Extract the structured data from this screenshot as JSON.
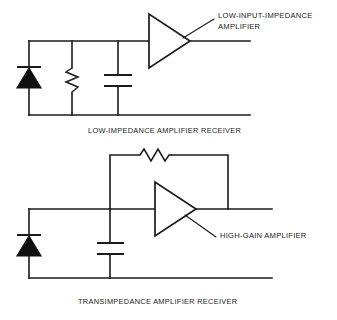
{
  "figure": {
    "type": "schematic-diagram",
    "background_color": "#ffffff",
    "line_color": "#1a1a1a"
  },
  "circuits": [
    {
      "id": "low-impedance-receiver",
      "caption": "LOW-IMPEDANCE AMPLIFIER RECEIVER",
      "annotation": {
        "line1": "LOW-INPUT-IMPEDANCE",
        "line2": "AMPLIFIER",
        "points_to": "amplifier-triangle"
      },
      "components": [
        {
          "name": "photodiode",
          "symbol": "diode",
          "orientation": "cathode-top"
        },
        {
          "name": "load-resistor",
          "symbol": "resistor",
          "orientation": "vertical"
        },
        {
          "name": "shunt-capacitor",
          "symbol": "capacitor",
          "orientation": "vertical"
        },
        {
          "name": "amplifier",
          "symbol": "triangle",
          "orientation": "pointing-right"
        }
      ]
    },
    {
      "id": "transimpedance-receiver",
      "caption": "TRANSIMPEDANCE AMPLIFIER RECEIVER",
      "annotation": {
        "line1": "HIGH-GAIN AMPLIFIER",
        "line2": "",
        "points_to": "amplifier-triangle"
      },
      "components": [
        {
          "name": "photodiode",
          "symbol": "diode",
          "orientation": "cathode-top"
        },
        {
          "name": "shunt-capacitor",
          "symbol": "capacitor",
          "orientation": "vertical"
        },
        {
          "name": "feedback-resistor",
          "symbol": "resistor",
          "orientation": "horizontal"
        },
        {
          "name": "amplifier",
          "symbol": "triangle",
          "orientation": "pointing-right"
        }
      ]
    }
  ]
}
